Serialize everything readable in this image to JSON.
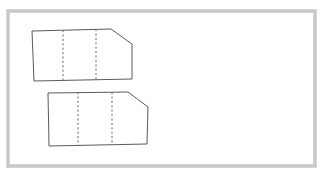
{
  "figure": {
    "type": "technical-line-drawing",
    "canvas": {
      "width": 323,
      "height": 176,
      "background": "#ffffff"
    },
    "frame": {
      "name": "outer-frame",
      "x": 8,
      "y": 11,
      "width": 307,
      "height": 155,
      "stroke": "#c9c9c9",
      "stroke_width": 3.5,
      "fill": "none"
    },
    "shapes": [
      {
        "name": "upper-panel",
        "label": "upper chamfered panel",
        "outline_points": "32,31 111,29 132,44 132,79 34,81",
        "stroke": "#5a5a5a",
        "stroke_width": 1,
        "fill": "#ffffff",
        "fold_lines": [
          {
            "name": "fold-line-1",
            "x1": 63,
            "y1": 30,
            "x2": 63,
            "y2": 80
          },
          {
            "name": "fold-line-2",
            "x1": 96,
            "y1": 29,
            "x2": 96,
            "y2": 80
          }
        ],
        "fold_stroke": "#6d6d6d",
        "fold_stroke_width": 1,
        "fold_dash": "2.2 2.2"
      },
      {
        "name": "lower-panel",
        "label": "lower chamfered panel",
        "outline_points": "48,93 128,92 148,107 147,144 49,146",
        "stroke": "#5a5a5a",
        "stroke_width": 1,
        "fill": "#ffffff",
        "fold_lines": [
          {
            "name": "fold-line-1",
            "x1": 78,
            "y1": 92,
            "x2": 78,
            "y2": 145
          },
          {
            "name": "fold-line-2",
            "x1": 112,
            "y1": 92,
            "x2": 112,
            "y2": 145
          }
        ],
        "fold_stroke": "#6d6d6d",
        "fold_stroke_width": 1,
        "fold_dash": "2.2 2.2"
      }
    ]
  }
}
